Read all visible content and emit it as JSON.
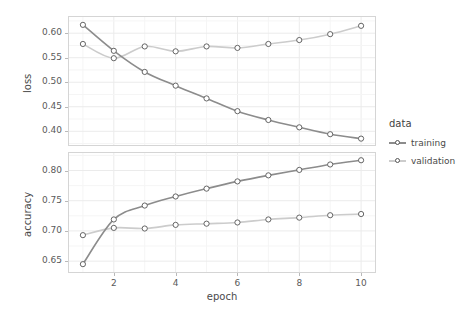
{
  "chart_data": {
    "type": "line",
    "title": "",
    "xlabel": "epoch",
    "x": [
      1,
      2,
      3,
      4,
      5,
      6,
      7,
      8,
      9,
      10
    ],
    "xlim": [
      0.55,
      10.45
    ],
    "xticks": [
      2,
      4,
      6,
      8,
      10
    ],
    "legend": {
      "title": "data",
      "position": "right",
      "entries": [
        {
          "label": "training",
          "color": "#8c8c8c"
        },
        {
          "label": "validation",
          "color": "#cccccc"
        }
      ]
    },
    "facets": [
      {
        "name": "loss",
        "ylabel": "loss",
        "ylim": [
          0.372,
          0.633
        ],
        "yticks": [
          0.4,
          0.45,
          0.5,
          0.55,
          0.6
        ],
        "ytick_labels": [
          "0.40",
          "0.45",
          "0.50",
          "0.55",
          "0.60"
        ],
        "series": [
          {
            "name": "training",
            "color": "#8c8c8c",
            "values": [
              0.617,
              0.564,
              0.521,
              0.493,
              0.467,
              0.441,
              0.423,
              0.408,
              0.394,
              0.385
            ]
          },
          {
            "name": "validation",
            "color": "#cccccc",
            "values": [
              0.578,
              0.549,
              0.573,
              0.563,
              0.573,
              0.57,
              0.578,
              0.586,
              0.598,
              0.615
            ]
          }
        ]
      },
      {
        "name": "accuracy",
        "ylabel": "accuracy",
        "ylim": [
          0.632,
          0.829
        ],
        "yticks": [
          0.65,
          0.7,
          0.75,
          0.8
        ],
        "ytick_labels": [
          "0.65",
          "0.70",
          "0.75",
          "0.80"
        ],
        "series": [
          {
            "name": "training",
            "color": "#8c8c8c",
            "values": [
              0.645,
              0.719,
              0.742,
              0.757,
              0.77,
              0.782,
              0.792,
              0.801,
              0.81,
              0.817
            ]
          },
          {
            "name": "validation",
            "color": "#cccccc",
            "values": [
              0.693,
              0.705,
              0.704,
              0.71,
              0.712,
              0.714,
              0.719,
              0.722,
              0.726,
              0.728
            ]
          }
        ]
      }
    ]
  },
  "style": {
    "panel_border": "#d5d5d5",
    "grid_major": "#ebebeb",
    "grid_minor": "#f5f5f5",
    "point_stroke": "#555555",
    "point_fill": "#ffffff",
    "axis_text": "#5a5a5a",
    "title_text": "#4a4a4a"
  }
}
